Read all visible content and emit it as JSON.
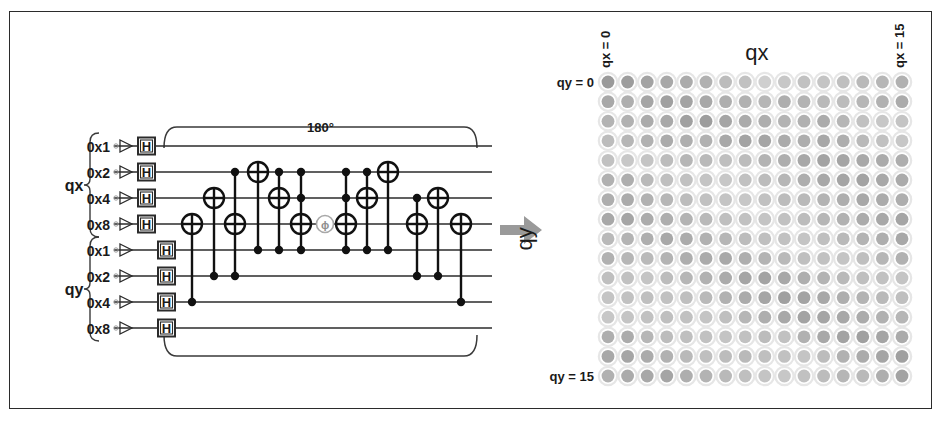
{
  "figure": {
    "background": "#ffffff",
    "frame_color": "#2b2b2b",
    "arrow_color": "#9a9a9a"
  },
  "circuit": {
    "angle_label": "180°",
    "group_labels": {
      "qx": "qx",
      "qy": "qy"
    },
    "qx_register": {
      "name": "qx",
      "wires": [
        {
          "label": "0x1",
          "hadamard": "H"
        },
        {
          "label": "0x2",
          "hadamard": "H"
        },
        {
          "label": "0x4",
          "hadamard": "H"
        },
        {
          "label": "0x8",
          "hadamard": "H"
        }
      ]
    },
    "qy_register": {
      "name": "qy",
      "wires": [
        {
          "label": "0x1",
          "hadamard": "H"
        },
        {
          "label": "0x2",
          "hadamard": "H"
        },
        {
          "label": "0x4",
          "hadamard": "H"
        },
        {
          "label": "0x8",
          "hadamard": "H"
        }
      ]
    },
    "gate_symbols": {
      "hadamard": "H",
      "phase": "ϕ",
      "target": "⊕",
      "control": "●"
    },
    "columns": [
      {
        "x": 178,
        "target": 3,
        "controls": [
          6
        ]
      },
      {
        "x": 200,
        "target": 2,
        "controls": [
          5
        ]
      },
      {
        "x": 221,
        "target": 3,
        "controls": [
          1,
          5
        ]
      },
      {
        "x": 244,
        "target": 1,
        "controls": [
          4
        ]
      },
      {
        "x": 265,
        "target": 2,
        "controls": [
          1,
          4
        ]
      },
      {
        "x": 287,
        "target": 3,
        "controls": [
          1,
          2,
          4
        ]
      },
      {
        "x": 311,
        "target": 3,
        "controls": [],
        "phase": true
      },
      {
        "x": 332,
        "target": 3,
        "controls": [
          1,
          2,
          4
        ]
      },
      {
        "x": 353,
        "target": 2,
        "controls": [
          1,
          4
        ]
      },
      {
        "x": 374,
        "target": 1,
        "controls": [
          4
        ]
      },
      {
        "x": 403,
        "target": 3,
        "controls": [
          2,
          5
        ]
      },
      {
        "x": 424,
        "target": 2,
        "controls": [
          5
        ]
      },
      {
        "x": 447,
        "target": 3,
        "controls": [
          6
        ]
      }
    ]
  },
  "plot": {
    "x_axis_title": "qx",
    "y_axis_title": "qy",
    "x_min_label": "qx = 0",
    "x_max_label": "qx = 15",
    "y_min_label": "qy = 0",
    "y_max_label": "qy = 15",
    "grid_size": 16,
    "dot_ring_color": "#e6e6e6",
    "dot_fill_base": "#808080"
  },
  "chart_data": {
    "type": "heatmap",
    "title": "",
    "xlabel": "qx",
    "ylabel": "qy",
    "xticklabels": [
      "qx = 0",
      "qx = 15"
    ],
    "yticklabels": [
      "qy = 0",
      "qy = 15"
    ],
    "xlim": [
      0,
      15
    ],
    "ylim": [
      0,
      15
    ],
    "grid": false,
    "legend": "none",
    "note": "16x16 grid of circles; fill darkness encodes amplitude/probability",
    "values": [
      [
        0.72,
        0.7,
        0.66,
        0.62,
        0.6,
        0.56,
        0.48,
        0.44,
        0.34,
        0.4,
        0.44,
        0.42,
        0.46,
        0.5,
        0.52,
        0.56
      ],
      [
        0.62,
        0.58,
        0.64,
        0.68,
        0.66,
        0.62,
        0.58,
        0.56,
        0.52,
        0.58,
        0.54,
        0.5,
        0.48,
        0.52,
        0.56,
        0.6
      ],
      [
        0.54,
        0.56,
        0.6,
        0.62,
        0.68,
        0.7,
        0.64,
        0.6,
        0.58,
        0.54,
        0.56,
        0.6,
        0.52,
        0.44,
        0.4,
        0.42
      ],
      [
        0.48,
        0.52,
        0.56,
        0.6,
        0.58,
        0.56,
        0.62,
        0.66,
        0.64,
        0.6,
        0.58,
        0.62,
        0.58,
        0.5,
        0.44,
        0.4
      ],
      [
        0.44,
        0.4,
        0.42,
        0.48,
        0.52,
        0.5,
        0.46,
        0.48,
        0.54,
        0.58,
        0.62,
        0.66,
        0.64,
        0.62,
        0.6,
        0.58
      ],
      [
        0.56,
        0.58,
        0.5,
        0.46,
        0.44,
        0.42,
        0.4,
        0.44,
        0.48,
        0.52,
        0.58,
        0.62,
        0.64,
        0.66,
        0.62,
        0.6
      ],
      [
        0.58,
        0.6,
        0.56,
        0.52,
        0.48,
        0.44,
        0.42,
        0.4,
        0.44,
        0.48,
        0.5,
        0.54,
        0.58,
        0.62,
        0.6,
        0.58
      ],
      [
        0.62,
        0.64,
        0.6,
        0.58,
        0.54,
        0.5,
        0.46,
        0.44,
        0.42,
        0.44,
        0.48,
        0.52,
        0.56,
        0.6,
        0.62,
        0.64
      ],
      [
        0.5,
        0.54,
        0.58,
        0.62,
        0.6,
        0.56,
        0.52,
        0.48,
        0.46,
        0.44,
        0.42,
        0.46,
        0.5,
        0.54,
        0.58,
        0.62
      ],
      [
        0.56,
        0.52,
        0.5,
        0.54,
        0.58,
        0.6,
        0.62,
        0.58,
        0.54,
        0.5,
        0.46,
        0.44,
        0.42,
        0.46,
        0.52,
        0.56
      ],
      [
        0.46,
        0.44,
        0.42,
        0.48,
        0.52,
        0.56,
        0.6,
        0.64,
        0.66,
        0.62,
        0.58,
        0.54,
        0.5,
        0.46,
        0.44,
        0.42
      ],
      [
        0.42,
        0.44,
        0.46,
        0.44,
        0.46,
        0.5,
        0.56,
        0.6,
        0.64,
        0.68,
        0.66,
        0.62,
        0.58,
        0.54,
        0.5,
        0.46
      ],
      [
        0.4,
        0.42,
        0.44,
        0.46,
        0.44,
        0.42,
        0.46,
        0.52,
        0.58,
        0.62,
        0.66,
        0.64,
        0.62,
        0.6,
        0.56,
        0.52
      ],
      [
        0.58,
        0.6,
        0.52,
        0.48,
        0.46,
        0.44,
        0.42,
        0.44,
        0.48,
        0.44,
        0.56,
        0.62,
        0.66,
        0.68,
        0.64,
        0.6
      ],
      [
        0.62,
        0.64,
        0.6,
        0.56,
        0.5,
        0.46,
        0.48,
        0.5,
        0.46,
        0.44,
        0.42,
        0.48,
        0.56,
        0.6,
        0.64,
        0.68
      ],
      [
        0.56,
        0.6,
        0.62,
        0.64,
        0.58,
        0.54,
        0.5,
        0.46,
        0.42,
        0.4,
        0.44,
        0.48,
        0.52,
        0.5,
        0.58,
        0.66
      ]
    ]
  }
}
